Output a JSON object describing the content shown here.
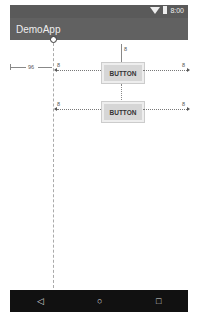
{
  "status_bar": {
    "time": "8:00",
    "icons": [
      "wifi-icon",
      "battery-icon"
    ]
  },
  "app_bar": {
    "title": "DemoApp"
  },
  "layout_editor": {
    "left_margin_label": "96",
    "buttons": [
      {
        "label": "BUTTON",
        "top_margin": "8",
        "left_margin": "8",
        "right_margin": "8"
      },
      {
        "label": "BUTTON",
        "top_margin": "8",
        "left_margin": "8",
        "right_margin": "8"
      }
    ]
  },
  "nav_bar": {
    "icons": [
      "back-icon",
      "home-icon",
      "recents-icon"
    ],
    "back": "◁",
    "home": "○",
    "recents": "□"
  }
}
